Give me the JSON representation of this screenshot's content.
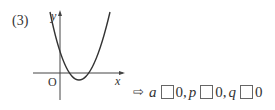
{
  "problem": {
    "number": "(3)"
  },
  "graph": {
    "type": "parabola",
    "opens": "up",
    "x_axis_label": "x",
    "y_axis_label": "y",
    "origin_label": "O",
    "features": {
      "y_intercept": "positive",
      "vertex": "fourth quadrant (x>0, y<0)",
      "x_intercepts": "two positive roots"
    }
  },
  "answer_template": {
    "arrow": "⇨",
    "items": [
      {
        "var": "a",
        "blank": "",
        "value": "0",
        "separator": ","
      },
      {
        "var": "p",
        "blank": "",
        "value": "0",
        "separator": ","
      },
      {
        "var": "q",
        "blank": "",
        "value": "0",
        "separator": ""
      }
    ]
  }
}
